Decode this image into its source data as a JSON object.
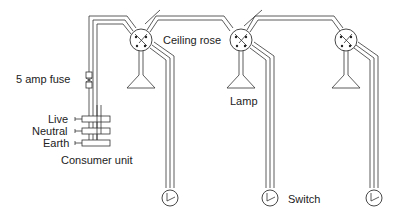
{
  "diagram": {
    "labels": {
      "fuse": "5 amp fuse",
      "ceiling_rose": "Ceiling rose",
      "lamp": "Lamp",
      "live": "Live",
      "neutral": "Neutral",
      "earth": "Earth",
      "consumer_unit": "Consumer unit",
      "switch": "Switch"
    },
    "components": {
      "ceiling_roses": 3,
      "lamps": 3,
      "switches": 3,
      "consumer_unit_terminals": [
        "Live",
        "Neutral",
        "Earth"
      ]
    },
    "colors": {
      "line": "#333333",
      "text": "#222222",
      "background": "#ffffff"
    }
  }
}
